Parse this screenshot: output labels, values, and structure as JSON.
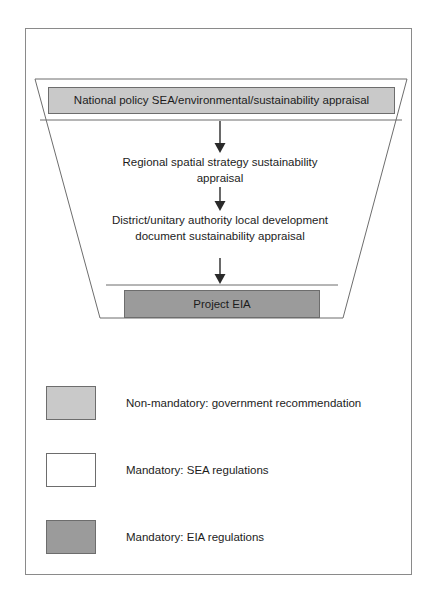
{
  "figure": {
    "colors": {
      "non_mandatory_fill": "#c9c9c9",
      "mandatory_sea_fill": "#ffffff",
      "mandatory_eia_fill": "#9b9b9b",
      "line": "#6d6d6d",
      "frame": "#8a8a8a",
      "text": "#1c1c1c"
    }
  },
  "funnel": {
    "shape": "trapezoid",
    "top_band_label": "National policy SEA/environmental/sustainability appraisal",
    "levels": [
      {
        "id": "national-policy",
        "label": "National policy SEA/environmental/sustainability appraisal",
        "style": "non-mandatory"
      },
      {
        "id": "regional-spatial-strategy",
        "label": "Regional spatial strategy sustainability appraisal",
        "style": "mandatory-sea"
      },
      {
        "id": "district-unitary-ldd",
        "label": "District/unitary authority local development document sustainability appraisal",
        "style": "mandatory-sea"
      },
      {
        "id": "project-eia",
        "label": "Project EIA",
        "style": "mandatory-eia"
      }
    ],
    "arrows": [
      {
        "from": "national-policy",
        "to": "regional-spatial-strategy",
        "direction": "down"
      },
      {
        "from": "regional-spatial-strategy",
        "to": "district-unitary-ldd",
        "direction": "down"
      },
      {
        "from": "district-unitary-ldd",
        "to": "project-eia",
        "direction": "down"
      }
    ]
  },
  "legend": {
    "items": [
      {
        "swatch": "#c9c9c9",
        "label": "Non-mandatory: government recommendation"
      },
      {
        "swatch": "#ffffff",
        "label": "Mandatory: SEA regulations"
      },
      {
        "swatch": "#9b9b9b",
        "label": "Mandatory: EIA regulations"
      }
    ]
  }
}
